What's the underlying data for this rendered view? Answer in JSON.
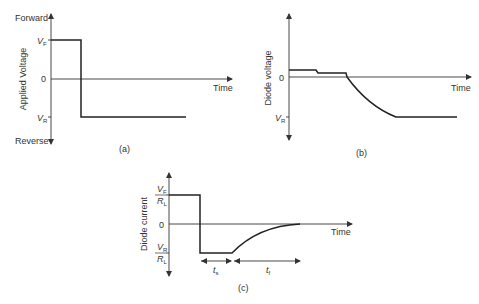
{
  "figure": {
    "panels": [
      {
        "id": "a",
        "caption": "(a)",
        "y_axis_label": "Applied Voltage",
        "x_axis_label": "Time",
        "top_label": "Forward",
        "bottom_label": "Reverse",
        "ticks": [
          {
            "main": "V",
            "sub": "F"
          },
          {
            "main": "0"
          },
          {
            "main": "V",
            "sub": "R"
          }
        ]
      },
      {
        "id": "b",
        "caption": "(b)",
        "y_axis_label": "Diode voltage",
        "x_axis_label": "Time",
        "ticks": [
          {
            "main": "0"
          },
          {
            "main": "V",
            "sub": "R"
          }
        ]
      },
      {
        "id": "c",
        "caption": "(c)",
        "y_axis_label": "Diode current",
        "x_axis_label": "Time",
        "ticks": [
          {
            "num": "V",
            "num_sub": "F",
            "den": "R",
            "den_sub": "L"
          },
          {
            "main": "0"
          },
          {
            "num": "V",
            "num_sub": "R",
            "den": "R",
            "den_sub": "L"
          }
        ],
        "intervals": [
          {
            "main": "t",
            "sub": "s"
          },
          {
            "main": "t",
            "sub": "f"
          }
        ]
      }
    ]
  }
}
